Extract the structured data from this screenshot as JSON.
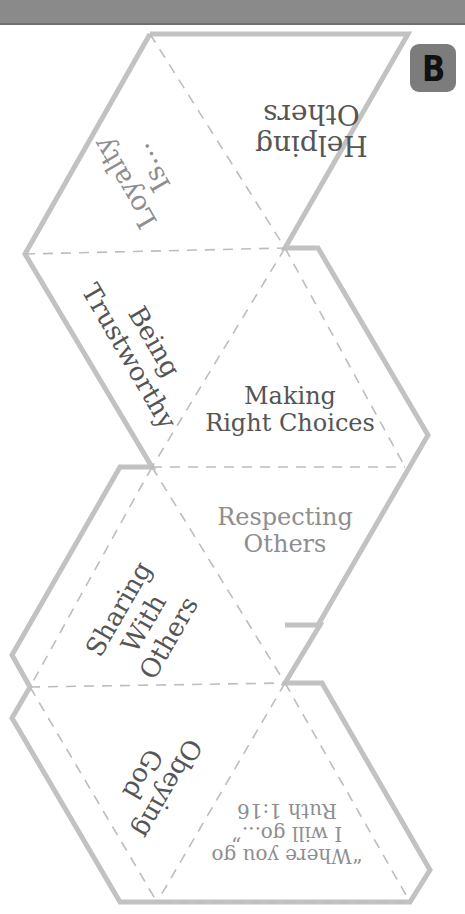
{
  "header": {
    "bar_color": "#8a8a8a"
  },
  "badge": {
    "letter": "B",
    "bg_color": "#7c7c7c"
  },
  "outline": {
    "stroke_color": "#c2c2c2",
    "fold_line_color": "#bdbdbd"
  },
  "faces": [
    {
      "id": "helping-others",
      "line1": "Helping",
      "line2": "Others",
      "orientation": "upside-down",
      "tone": "dark"
    },
    {
      "id": "loyalty-is",
      "line1": "Loyalty",
      "line2": "Is...",
      "orientation": "rotated",
      "tone": "light"
    },
    {
      "id": "being-trustworthy",
      "line1": "Being",
      "line2": "Trustworthy",
      "orientation": "rotated",
      "tone": "dark"
    },
    {
      "id": "making-right-choices",
      "line1": "Making",
      "line2": "Right Choices",
      "orientation": "upright",
      "tone": "dark"
    },
    {
      "id": "respecting-others",
      "line1": "Respecting",
      "line2": "Others",
      "orientation": "upright",
      "tone": "light"
    },
    {
      "id": "sharing-with-others",
      "line1": "Sharing",
      "line2": "With",
      "line3": "Others",
      "orientation": "rotated",
      "tone": "dark"
    },
    {
      "id": "obeying-god",
      "line1": "Obeying",
      "line2": "God",
      "orientation": "rotated",
      "tone": "dark"
    },
    {
      "id": "ruth-verse",
      "line1": "“Where you go",
      "line2": "I will go...”",
      "line3": "Ruth 1:16",
      "orientation": "upside-down",
      "tone": "light"
    }
  ]
}
